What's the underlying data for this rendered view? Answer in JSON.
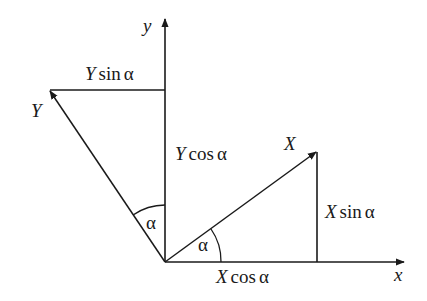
{
  "diagram": {
    "axes": {
      "x_label": "x",
      "y_label": "y"
    },
    "vectors": {
      "X_label": "X",
      "Y_label": "Y"
    },
    "components": {
      "Y_sin": {
        "var": "Y",
        "fn": "sin",
        "angle": "α"
      },
      "Y_cos": {
        "var": "Y",
        "fn": "cos",
        "angle": "α"
      },
      "X_sin": {
        "var": "X",
        "fn": "sin",
        "angle": "α"
      },
      "X_cos": {
        "var": "X",
        "fn": "cos",
        "angle": "α"
      }
    },
    "angles": {
      "left_angle_label": "α",
      "right_angle_label": "α"
    },
    "stroke_color": "#1a1a1a"
  }
}
